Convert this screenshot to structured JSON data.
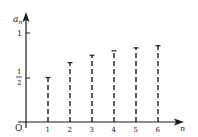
{
  "chart_data": {
    "type": "scatter",
    "style": "stem plot with dashed vertical lines and T-shaped caps",
    "title": "",
    "xlabel": "n",
    "ylabel": "a_n",
    "origin_label": "O",
    "x": [
      1,
      2,
      3,
      4,
      5,
      6
    ],
    "values": [
      0.5,
      0.667,
      0.75,
      0.8,
      0.833,
      0.857
    ],
    "x_tick_labels": [
      "1",
      "2",
      "3",
      "4",
      "5",
      "6"
    ],
    "y_ticks": [
      {
        "value": 0.5,
        "label": "1/2"
      },
      {
        "value": 1,
        "label": "1"
      }
    ],
    "xlim": [
      0,
      7
    ],
    "ylim": [
      0,
      1.15
    ],
    "grid": false,
    "legend": null
  },
  "labels": {
    "x_axis": "n",
    "y_axis_main": "a",
    "y_axis_sub": "n",
    "origin": "O",
    "y_one": "1",
    "y_half_num": "1",
    "y_half_den": "2"
  },
  "colors": {
    "ink": "#1a1a1a",
    "background": "#ffffff"
  }
}
